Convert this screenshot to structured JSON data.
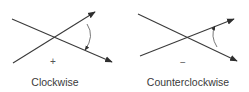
{
  "diagrams": [
    {
      "id": "clockwise",
      "label": "Clockwise",
      "sign": "+",
      "label_x": 55,
      "sign_pos": [
        53,
        61
      ],
      "line_a": {
        "from": [
          12,
          19
        ],
        "to": [
          112,
          62
        ]
      },
      "line_b": {
        "from": [
          13,
          63
        ],
        "to": [
          95,
          12
        ]
      },
      "rotation_arrow": {
        "path": "M 87 24 Q 95 36 85 50",
        "direction": "down"
      }
    },
    {
      "id": "counterclockwise",
      "label": "Counterclockwise",
      "sign": "−",
      "label_x": 188,
      "sign_pos": [
        183,
        62
      ],
      "line_a": {
        "from": [
          138,
          14
        ],
        "to": [
          237,
          61
        ]
      },
      "line_b": {
        "from": [
          140,
          56
        ],
        "to": [
          234,
          19
        ]
      },
      "rotation_arrow": {
        "path": "M 217 47 Q 210 36 215 26",
        "direction": "up"
      }
    }
  ],
  "colors": {
    "line": "#3a3a3a",
    "background": "#ffffff"
  }
}
